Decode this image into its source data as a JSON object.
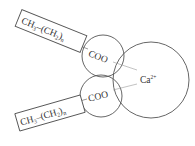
{
  "diagram": {
    "colors": {
      "stroke": "#555555",
      "text": "#333333",
      "bond": "#999999",
      "background": "#ffffff"
    },
    "upper_chain": {
      "base": "CH",
      "sub1": "3",
      "dash": "–(CH",
      "sub2": "2",
      "close": ")",
      "sub3": "n"
    },
    "lower_chain": {
      "base": "CH",
      "sub1": "3",
      "dash": "–(CH",
      "sub2": "2",
      "close": ")",
      "sub3": "n"
    },
    "upper_group": {
      "label": "COO"
    },
    "lower_group": {
      "label": "COO"
    },
    "ion": {
      "symbol": "Ca",
      "charge": "2+"
    }
  }
}
